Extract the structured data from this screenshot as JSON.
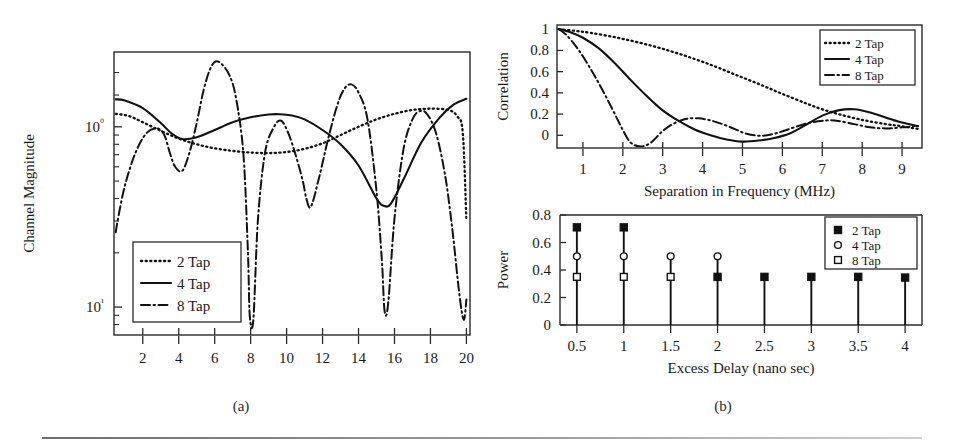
{
  "figure": {
    "caption_a": "(a)",
    "caption_b": "(b)"
  },
  "chart_data": [
    {
      "id": "channel-magnitude",
      "type": "line",
      "title": "",
      "xlabel": "",
      "ylabel": "Channel Magnitude",
      "xlim": [
        0.4,
        20.2
      ],
      "ylim_log": [
        0.07,
        2.6
      ],
      "yscale": "log",
      "grid": false,
      "xticks": [
        2,
        4,
        6,
        8,
        10,
        12,
        14,
        16,
        18,
        20
      ],
      "xticklabels": [
        "2",
        "4",
        "6",
        "8",
        "10",
        "12",
        "14",
        "16",
        "18",
        "20"
      ],
      "yticks": [
        1,
        0.1
      ],
      "yticklabels": [
        "10⁰",
        "10¹"
      ],
      "legend_position": "lower-left",
      "legend": [
        "2 Tap",
        "4 Tap",
        "8 Tap"
      ],
      "series": [
        {
          "name": "2 Tap",
          "style": "dotted",
          "x": [
            0.5,
            1.2,
            2.0,
            3.0,
            4.0,
            5.0,
            6.0,
            7.0,
            8.0,
            9.0,
            10.0,
            11.0,
            12.0,
            13.0,
            14.0,
            15.0,
            16.0,
            17.0,
            18.0,
            19.0,
            19.5,
            19.8,
            20.0
          ],
          "y": [
            1.18,
            1.15,
            1.06,
            0.95,
            0.86,
            0.8,
            0.76,
            0.735,
            0.72,
            0.715,
            0.725,
            0.755,
            0.81,
            0.9,
            1.0,
            1.1,
            1.18,
            1.24,
            1.26,
            1.24,
            1.14,
            0.92,
            0.3
          ]
        },
        {
          "name": "4 Tap",
          "style": "solid",
          "x": [
            0.5,
            1.0,
            2.0,
            3.0,
            3.6,
            4.2,
            5.0,
            6.0,
            7.0,
            8.0,
            9.0,
            9.6,
            10.3,
            11.0,
            12.0,
            13.0,
            14.0,
            15.0,
            15.4,
            15.8,
            16.5,
            17.5,
            18.5,
            19.3,
            20.0
          ],
          "y": [
            1.42,
            1.4,
            1.27,
            1.05,
            0.92,
            0.855,
            0.875,
            0.96,
            1.06,
            1.13,
            1.17,
            1.175,
            1.155,
            1.1,
            0.96,
            0.8,
            0.61,
            0.4,
            0.365,
            0.375,
            0.51,
            0.82,
            1.12,
            1.33,
            1.43
          ]
        },
        {
          "name": "8 Tap",
          "style": "dashdot",
          "x": [
            0.5,
            0.6,
            1.0,
            1.6,
            2.2,
            2.8,
            3.2,
            3.5,
            3.8,
            4.2,
            4.6,
            5.0,
            5.4,
            5.8,
            6.2,
            6.8,
            7.2,
            7.6,
            7.85,
            7.95,
            8.15,
            8.4,
            8.8,
            9.3,
            9.7,
            10.1,
            10.5,
            10.9,
            11.1,
            11.35,
            11.8,
            12.3,
            12.8,
            13.2,
            13.6,
            14.0,
            14.5,
            15.0,
            15.3,
            15.45,
            15.65,
            16.0,
            16.5,
            17.0,
            17.4,
            17.8,
            18.3,
            18.8,
            19.2,
            19.6,
            19.85,
            20.0
          ],
          "y": [
            0.26,
            0.3,
            0.47,
            0.72,
            0.92,
            0.98,
            0.9,
            0.72,
            0.6,
            0.57,
            0.72,
            1.05,
            1.62,
            2.15,
            2.3,
            1.95,
            1.42,
            0.7,
            0.2,
            0.09,
            0.085,
            0.3,
            0.72,
            1.0,
            1.08,
            0.92,
            0.7,
            0.5,
            0.4,
            0.36,
            0.52,
            0.85,
            1.3,
            1.62,
            1.72,
            1.55,
            1.1,
            0.44,
            0.18,
            0.095,
            0.105,
            0.31,
            0.75,
            1.1,
            1.22,
            1.18,
            0.93,
            0.55,
            0.28,
            0.12,
            0.085,
            0.11
          ]
        }
      ]
    },
    {
      "id": "correlation",
      "type": "line",
      "title": "",
      "xlabel": "Separation in Frequency (MHz)",
      "ylabel": "Correlation",
      "xlim": [
        0.35,
        9.5
      ],
      "ylim": [
        -0.12,
        1.04
      ],
      "grid": false,
      "xticks": [
        1,
        2,
        3,
        4,
        5,
        6,
        7,
        8,
        9
      ],
      "xticklabels": [
        "1",
        "2",
        "3",
        "4",
        "5",
        "6",
        "7",
        "8",
        "9"
      ],
      "yticks": [
        0,
        0.2,
        0.4,
        0.6,
        0.8,
        1
      ],
      "yticklabels": [
        "0",
        "0.2",
        "0.4",
        "0.6",
        "0.8",
        "1"
      ],
      "legend_position": "upper-right",
      "legend": [
        "2 Tap",
        "4 Tap",
        "8 Tap"
      ],
      "series": [
        {
          "name": "2 Tap",
          "style": "dotted",
          "x": [
            0.4,
            0.8,
            1.2,
            1.8,
            2.4,
            3.0,
            3.6,
            4.2,
            4.8,
            5.4,
            6.0,
            6.6,
            7.0,
            7.4,
            8.0,
            8.6,
            9.0,
            9.4
          ],
          "y": [
            1.0,
            0.985,
            0.965,
            0.925,
            0.875,
            0.815,
            0.745,
            0.665,
            0.575,
            0.485,
            0.39,
            0.3,
            0.245,
            0.2,
            0.145,
            0.105,
            0.085,
            0.06
          ]
        },
        {
          "name": "4 Tap",
          "style": "solid",
          "x": [
            0.4,
            0.7,
            1.0,
            1.4,
            1.8,
            2.2,
            2.6,
            3.0,
            3.4,
            3.8,
            4.2,
            4.6,
            5.0,
            5.4,
            5.8,
            6.2,
            6.6,
            7.0,
            7.4,
            7.8,
            8.2,
            8.6,
            9.0,
            9.4
          ],
          "y": [
            1.0,
            0.97,
            0.92,
            0.82,
            0.68,
            0.52,
            0.37,
            0.235,
            0.135,
            0.055,
            0.0,
            -0.04,
            -0.06,
            -0.05,
            -0.025,
            0.02,
            0.1,
            0.185,
            0.235,
            0.245,
            0.215,
            0.165,
            0.12,
            0.085
          ]
        },
        {
          "name": "8 Tap",
          "style": "dashdot",
          "x": [
            0.4,
            0.6,
            0.9,
            1.2,
            1.5,
            1.8,
            2.0,
            2.2,
            2.45,
            2.7,
            3.0,
            3.3,
            3.6,
            3.9,
            4.2,
            4.5,
            4.8,
            5.1,
            5.5,
            5.9,
            6.3,
            6.7,
            7.1,
            7.4,
            7.8,
            8.2,
            8.6,
            9.0,
            9.4
          ],
          "y": [
            1.0,
            0.94,
            0.8,
            0.62,
            0.42,
            0.2,
            0.05,
            -0.07,
            -0.105,
            -0.07,
            0.04,
            0.115,
            0.155,
            0.16,
            0.14,
            0.105,
            0.06,
            0.015,
            -0.005,
            0.025,
            0.075,
            0.12,
            0.14,
            0.135,
            0.105,
            0.075,
            0.065,
            0.075,
            0.09
          ]
        }
      ]
    },
    {
      "id": "power-delay",
      "type": "stem",
      "title": "",
      "xlabel": "Excess Delay (nano sec)",
      "ylabel": "Power",
      "xlim": [
        0.32,
        4.18
      ],
      "ylim": [
        0,
        0.8
      ],
      "grid": false,
      "xticks": [
        0.5,
        1,
        1.5,
        2,
        2.5,
        3,
        3.5,
        4
      ],
      "xticklabels": [
        "0.5",
        "1",
        "1.5",
        "2",
        "2.5",
        "3",
        "3.5",
        "4"
      ],
      "yticks": [
        0,
        0.2,
        0.4,
        0.6,
        0.8
      ],
      "yticklabels": [
        "0",
        "0.2",
        "0.4",
        "0.6",
        "0.8"
      ],
      "legend_position": "upper-right",
      "legend": [
        "2 Tap",
        "4 Tap",
        "8 Tap"
      ],
      "series": [
        {
          "name": "2 Tap",
          "marker": "filled-square",
          "x": [
            0.5,
            1,
            2,
            2.5,
            3,
            3.5,
            4
          ],
          "y": [
            0.71,
            0.71,
            0.35,
            0.35,
            0.35,
            0.35,
            0.345
          ]
        },
        {
          "name": "4 Tap",
          "marker": "open-circle",
          "x": [
            0.5,
            1,
            1.5,
            2
          ],
          "y": [
            0.5,
            0.5,
            0.5,
            0.5
          ]
        },
        {
          "name": "8 Tap",
          "marker": "open-square",
          "x": [
            0.5,
            1,
            1.5
          ],
          "y": [
            0.35,
            0.35,
            0.35
          ]
        }
      ]
    }
  ]
}
